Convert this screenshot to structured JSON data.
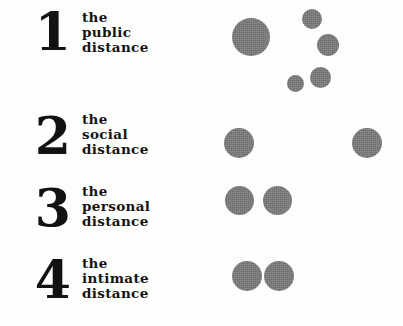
{
  "diagram": {
    "background_color": "#fdfdfc",
    "dot_color": "#6e6e6e",
    "text_color": "#141414",
    "rows": [
      {
        "numeral": "1",
        "label_lines": [
          "the",
          "public",
          "distance"
        ],
        "name": "public-distance",
        "numeral_x": 8,
        "numeral_y": 6,
        "label_x": 82,
        "label_y": 10,
        "dots": [
          {
            "cx": 251,
            "cy": 37,
            "d": 38
          },
          {
            "cx": 312,
            "cy": 19,
            "d": 20
          },
          {
            "cx": 328,
            "cy": 45,
            "d": 22
          },
          {
            "cx": 320,
            "cy": 77,
            "d": 21
          },
          {
            "cx": 295,
            "cy": 83,
            "d": 17
          }
        ]
      },
      {
        "numeral": "2",
        "label_lines": [
          "the",
          "social",
          "distance"
        ],
        "name": "social-distance",
        "numeral_x": 8,
        "numeral_y": 110,
        "label_x": 82,
        "label_y": 112,
        "dots": [
          {
            "cx": 239,
            "cy": 143,
            "d": 30
          },
          {
            "cx": 367,
            "cy": 143,
            "d": 30
          }
        ]
      },
      {
        "numeral": "3",
        "label_lines": [
          "the",
          "personal",
          "distance"
        ],
        "name": "personal-distance",
        "numeral_x": 8,
        "numeral_y": 182,
        "label_x": 82,
        "label_y": 184,
        "dots": [
          {
            "cx": 239,
            "cy": 200,
            "d": 29
          },
          {
            "cx": 277,
            "cy": 200,
            "d": 29
          }
        ]
      },
      {
        "numeral": "4",
        "label_lines": [
          "the",
          "intimate",
          "distance"
        ],
        "name": "intimate-distance",
        "numeral_x": 8,
        "numeral_y": 254,
        "label_x": 82,
        "label_y": 256,
        "dots": [
          {
            "cx": 247,
            "cy": 276,
            "d": 30
          },
          {
            "cx": 279,
            "cy": 276,
            "d": 30
          }
        ]
      }
    ]
  }
}
